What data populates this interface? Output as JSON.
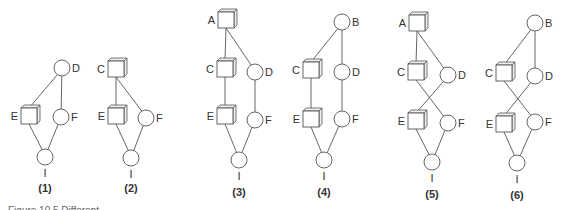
{
  "figure": {
    "caption": "Figure 10.5  Different ..."
  },
  "style": {
    "stroke_color": "#555555",
    "box_side_color": "#eeeeee",
    "text_color": "#333333"
  },
  "diagrams": [
    {
      "id": "1",
      "label": "(1)",
      "label_pos": [
        45,
        192
      ],
      "nodes": [
        {
          "name": "D",
          "shape": "circle",
          "x": 62,
          "y": 68,
          "label_side": "right"
        },
        {
          "name": "E",
          "shape": "box",
          "x": 29,
          "y": 116,
          "label_side": "left"
        },
        {
          "name": "F",
          "shape": "circle",
          "x": 61,
          "y": 117,
          "label_side": "right"
        },
        {
          "name": "I",
          "shape": "circle",
          "x": 45,
          "y": 157,
          "label_side": "below"
        }
      ],
      "edges": [
        [
          "D",
          "E"
        ],
        [
          "D",
          "F"
        ],
        [
          "E",
          "I"
        ],
        [
          "F",
          "I"
        ]
      ]
    },
    {
      "id": "2",
      "label": "(2)",
      "label_pos": [
        131,
        192
      ],
      "nodes": [
        {
          "name": "C",
          "shape": "box",
          "x": 116,
          "y": 69,
          "label_side": "left"
        },
        {
          "name": "E",
          "shape": "box",
          "x": 116,
          "y": 116,
          "label_side": "left"
        },
        {
          "name": "F",
          "shape": "circle",
          "x": 146,
          "y": 118,
          "label_side": "right"
        },
        {
          "name": "I",
          "shape": "circle",
          "x": 131,
          "y": 158,
          "label_side": "below"
        }
      ],
      "edges": [
        [
          "C",
          "E"
        ],
        [
          "C",
          "F"
        ],
        [
          "E",
          "I"
        ],
        [
          "F",
          "I"
        ]
      ]
    },
    {
      "id": "3",
      "label": "(3)",
      "label_pos": [
        239,
        196
      ],
      "nodes": [
        {
          "name": "A",
          "shape": "box",
          "x": 226,
          "y": 20,
          "label_side": "left"
        },
        {
          "name": "C",
          "shape": "box",
          "x": 225,
          "y": 69,
          "label_side": "left"
        },
        {
          "name": "D",
          "shape": "circle",
          "x": 255,
          "y": 72,
          "label_side": "right"
        },
        {
          "name": "E",
          "shape": "box",
          "x": 225,
          "y": 116,
          "label_side": "left"
        },
        {
          "name": "F",
          "shape": "circle",
          "x": 255,
          "y": 120,
          "label_side": "right"
        },
        {
          "name": "I",
          "shape": "circle",
          "x": 239,
          "y": 160,
          "label_side": "below"
        }
      ],
      "edges": [
        [
          "A",
          "C"
        ],
        [
          "A",
          "D"
        ],
        [
          "C",
          "E"
        ],
        [
          "D",
          "F"
        ],
        [
          "E",
          "I"
        ],
        [
          "F",
          "I"
        ]
      ]
    },
    {
      "id": "4",
      "label": "(4)",
      "label_pos": [
        324,
        196
      ],
      "nodes": [
        {
          "name": "B",
          "shape": "circle",
          "x": 342,
          "y": 22,
          "label_side": "right"
        },
        {
          "name": "C",
          "shape": "box",
          "x": 311,
          "y": 70,
          "label_side": "left"
        },
        {
          "name": "D",
          "shape": "circle",
          "x": 342,
          "y": 72,
          "label_side": "right"
        },
        {
          "name": "E",
          "shape": "box",
          "x": 311,
          "y": 119,
          "label_side": "left"
        },
        {
          "name": "F",
          "shape": "circle",
          "x": 342,
          "y": 119,
          "label_side": "right"
        },
        {
          "name": "I",
          "shape": "circle",
          "x": 324,
          "y": 160,
          "label_side": "below"
        }
      ],
      "edges": [
        [
          "B",
          "C"
        ],
        [
          "B",
          "D"
        ],
        [
          "C",
          "E"
        ],
        [
          "D",
          "F"
        ],
        [
          "E",
          "I"
        ],
        [
          "F",
          "I"
        ]
      ]
    },
    {
      "id": "5",
      "label": "(5)",
      "label_pos": [
        432,
        198
      ],
      "nodes": [
        {
          "name": "A",
          "shape": "box",
          "x": 417,
          "y": 23,
          "label_side": "left"
        },
        {
          "name": "C",
          "shape": "box",
          "x": 416,
          "y": 72,
          "label_side": "left"
        },
        {
          "name": "D",
          "shape": "circle",
          "x": 448,
          "y": 75,
          "label_side": "right"
        },
        {
          "name": "E",
          "shape": "box",
          "x": 416,
          "y": 121,
          "label_side": "left"
        },
        {
          "name": "F",
          "shape": "circle",
          "x": 448,
          "y": 123,
          "label_side": "right"
        },
        {
          "name": "I",
          "shape": "circle",
          "x": 432,
          "y": 162,
          "label_side": "below"
        }
      ],
      "edges": [
        [
          "A",
          "C"
        ],
        [
          "A",
          "D"
        ],
        [
          "C",
          "F"
        ],
        [
          "D",
          "E"
        ],
        [
          "E",
          "I"
        ],
        [
          "F",
          "I"
        ]
      ]
    },
    {
      "id": "6",
      "label": "(6)",
      "label_pos": [
        517,
        199
      ],
      "nodes": [
        {
          "name": "B",
          "shape": "circle",
          "x": 535,
          "y": 23,
          "label_side": "right"
        },
        {
          "name": "C",
          "shape": "box",
          "x": 504,
          "y": 73,
          "label_side": "left"
        },
        {
          "name": "D",
          "shape": "circle",
          "x": 535,
          "y": 76,
          "label_side": "right"
        },
        {
          "name": "E",
          "shape": "box",
          "x": 504,
          "y": 124,
          "label_side": "left"
        },
        {
          "name": "F",
          "shape": "circle",
          "x": 535,
          "y": 122,
          "label_side": "right"
        },
        {
          "name": "I",
          "shape": "circle",
          "x": 517,
          "y": 163,
          "label_side": "below"
        }
      ],
      "edges": [
        [
          "B",
          "C"
        ],
        [
          "B",
          "D"
        ],
        [
          "C",
          "F"
        ],
        [
          "D",
          "E"
        ],
        [
          "E",
          "I"
        ],
        [
          "F",
          "I"
        ]
      ]
    }
  ]
}
